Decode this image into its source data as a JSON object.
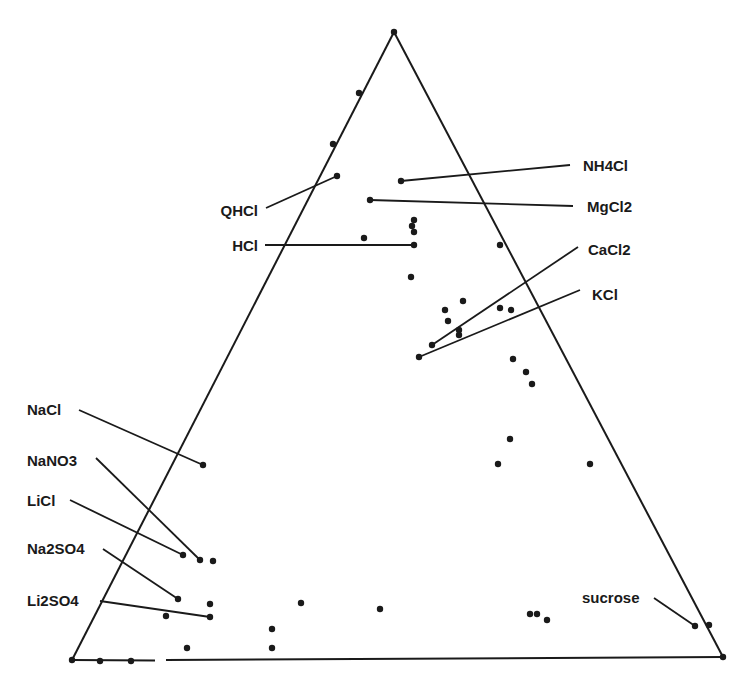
{
  "diagram": {
    "type": "ternary",
    "vertices": {
      "top": [
        394,
        32
      ],
      "left": [
        72,
        660
      ],
      "right": [
        723,
        657
      ]
    },
    "labels": [
      {
        "id": "nh4cl",
        "text": "NH4Cl",
        "x": 583,
        "y": 171,
        "anchor": "start",
        "leader": [
          [
            401,
            181
          ],
          [
            570,
            165
          ]
        ]
      },
      {
        "id": "mgcl2",
        "text": "MgCl2",
        "x": 587,
        "y": 212,
        "anchor": "start",
        "leader": [
          [
            370,
            200
          ],
          [
            573,
            206
          ]
        ]
      },
      {
        "id": "qhcl",
        "text": "QHCl",
        "x": 258,
        "y": 216,
        "anchor": "end",
        "leader": [
          [
            266,
            208
          ],
          [
            337,
            176
          ]
        ]
      },
      {
        "id": "hcl",
        "text": "HCl",
        "x": 258,
        "y": 251,
        "anchor": "end",
        "leader": [
          [
            265,
            245
          ],
          [
            414,
            245
          ]
        ]
      },
      {
        "id": "cacl2",
        "text": "CaCl2",
        "x": 588,
        "y": 255,
        "anchor": "start",
        "leader": [
          [
            578,
            247
          ],
          [
            432,
            345
          ]
        ]
      },
      {
        "id": "kcl",
        "text": "KCl",
        "x": 592,
        "y": 300,
        "anchor": "start",
        "leader": [
          [
            580,
            290
          ],
          [
            419,
            357
          ]
        ]
      },
      {
        "id": "nacl",
        "text": "NaCl",
        "x": 27,
        "y": 415,
        "anchor": "start",
        "leader": [
          [
            79,
            410
          ],
          [
            203,
            465
          ]
        ]
      },
      {
        "id": "nano3",
        "text": "NaNO3",
        "x": 27,
        "y": 466,
        "anchor": "start",
        "leader": [
          [
            96,
            458
          ],
          [
            200,
            560
          ]
        ]
      },
      {
        "id": "licl",
        "text": "LiCl",
        "x": 27,
        "y": 506,
        "anchor": "start",
        "leader": [
          [
            70,
            500
          ],
          [
            183,
            555
          ]
        ]
      },
      {
        "id": "na2so4",
        "text": "Na2SO4",
        "x": 27,
        "y": 554,
        "anchor": "start",
        "leader": [
          [
            103,
            549
          ],
          [
            178,
            599
          ]
        ]
      },
      {
        "id": "li2so4",
        "text": "Li2SO4",
        "x": 27,
        "y": 606,
        "anchor": "start",
        "leader": [
          [
            100,
            601
          ],
          [
            210,
            617
          ]
        ]
      },
      {
        "id": "sucrose",
        "text": "sucrose",
        "x": 582,
        "y": 603,
        "anchor": "start",
        "leader": [
          [
            654,
            598
          ],
          [
            695,
            626
          ]
        ]
      }
    ],
    "points": [
      [
        394,
        32
      ],
      [
        359,
        93
      ],
      [
        333,
        144
      ],
      [
        337,
        176
      ],
      [
        401,
        181
      ],
      [
        370,
        200
      ],
      [
        414,
        220
      ],
      [
        412,
        226
      ],
      [
        414,
        232
      ],
      [
        414,
        245
      ],
      [
        364,
        238
      ],
      [
        500,
        245
      ],
      [
        411,
        277
      ],
      [
        445,
        310
      ],
      [
        463,
        301
      ],
      [
        448,
        321
      ],
      [
        500,
        308
      ],
      [
        511,
        310
      ],
      [
        459,
        330
      ],
      [
        459,
        335
      ],
      [
        432,
        345
      ],
      [
        419,
        357
      ],
      [
        513,
        359
      ],
      [
        526,
        372
      ],
      [
        532,
        384
      ],
      [
        510,
        439
      ],
      [
        498,
        464
      ],
      [
        590,
        464
      ],
      [
        203,
        465
      ],
      [
        183,
        555
      ],
      [
        200,
        560
      ],
      [
        213,
        561
      ],
      [
        178,
        599
      ],
      [
        210,
        604
      ],
      [
        210,
        617
      ],
      [
        166,
        616
      ],
      [
        301,
        603
      ],
      [
        380,
        609
      ],
      [
        272,
        629
      ],
      [
        272,
        648
      ],
      [
        187,
        648
      ],
      [
        530,
        614
      ],
      [
        537,
        614
      ],
      [
        547,
        620
      ],
      [
        695,
        626
      ],
      [
        709,
        625
      ],
      [
        100,
        661
      ],
      [
        131,
        661
      ],
      [
        72,
        660
      ],
      [
        723,
        657
      ]
    ]
  }
}
